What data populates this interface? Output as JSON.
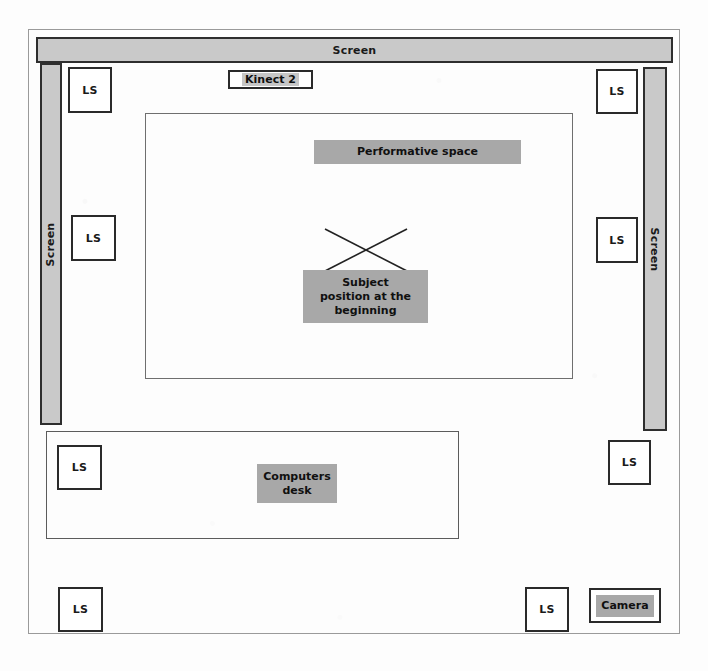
{
  "diagram": {
    "colors": {
      "screen_fill": "#c9c9c9",
      "label_fill": "#a8a8a8",
      "outline": "#2a2a2a",
      "paper": "#ffffff"
    },
    "room": {
      "outer_frame_name": "room-outline"
    },
    "screens": [
      {
        "id": "screen-top",
        "label": "Screen",
        "orientation": "horizontal"
      },
      {
        "id": "screen-left",
        "label": "Screen",
        "orientation": "vertical-left"
      },
      {
        "id": "screen-right",
        "label": "Screen",
        "orientation": "vertical-right"
      }
    ],
    "sensors": [
      {
        "id": "kinect",
        "label": "Kinect 2"
      },
      {
        "id": "camera",
        "label": "Camera"
      }
    ],
    "loudspeakers": [
      {
        "id": "ls-top-left",
        "label": "LS",
        "x": 68,
        "y": 67,
        "w": 44,
        "h": 46
      },
      {
        "id": "ls-top-right",
        "label": "LS",
        "x": 596,
        "y": 69,
        "w": 42,
        "h": 45
      },
      {
        "id": "ls-mid-left",
        "label": "LS",
        "x": 71,
        "y": 215,
        "w": 45,
        "h": 46
      },
      {
        "id": "ls-mid-right",
        "label": "LS",
        "x": 596,
        "y": 217,
        "w": 42,
        "h": 46
      },
      {
        "id": "ls-desk-left",
        "label": "LS",
        "x": 57,
        "y": 445,
        "w": 45,
        "h": 45
      },
      {
        "id": "ls-lower-right",
        "label": "LS",
        "x": 608,
        "y": 440,
        "w": 43,
        "h": 45
      },
      {
        "id": "ls-bottom-left",
        "label": "LS",
        "x": 58,
        "y": 587,
        "w": 45,
        "h": 45
      },
      {
        "id": "ls-bottom-right",
        "label": "LS",
        "x": 525,
        "y": 587,
        "w": 44,
        "h": 45
      }
    ],
    "areas": [
      {
        "id": "performative-area",
        "label": "Performative space"
      },
      {
        "id": "computers-desk-area",
        "label_line1": "Computers",
        "label_line2": "desk"
      }
    ],
    "annotations": {
      "performative_space": "Performative space",
      "subject_position_line1": "Subject",
      "subject_position_line2": "position at the",
      "subject_position_line3": "beginning",
      "computers_desk_line1": "Computers",
      "computers_desk_line2": "desk",
      "subject_marker_icon": "x-cross-icon"
    }
  }
}
